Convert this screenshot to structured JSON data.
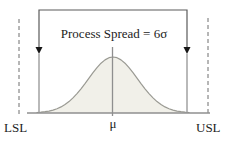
{
  "diagram": {
    "spread_label": "Process Spread = 6σ",
    "mean_label": "μ",
    "lsl_label": "LSL",
    "usl_label": "USL",
    "colors": {
      "background": "#ffffff",
      "text": "#1c1c1c",
      "bracket": "#5a5a5a",
      "arrowhead": "#161616",
      "dashed_limit_line": "#6e6e6e",
      "sigma_line": "#a8a8a8",
      "mean_line": "#8f8f8f",
      "baseline": "#8f8f8f",
      "curve_stroke": "#9a9a93",
      "curve_fill": "#f1f0e9"
    }
  }
}
